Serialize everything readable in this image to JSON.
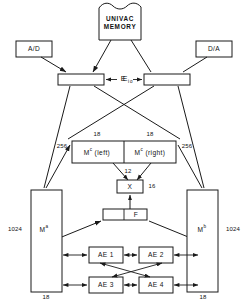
{
  "diagram": {
    "nodes": {
      "univac": {
        "line1": "UNIVAC",
        "line2": "MEMORY",
        "name": "univac-memory"
      },
      "ad": {
        "label": "A/D"
      },
      "da": {
        "label": "D/A"
      },
      "ei": {
        "label": "E",
        "sub": "i"
      },
      "eo": {
        "label": "E",
        "sub": "o"
      },
      "mc_left": {
        "label": "M",
        "sup": "c",
        "suffix": " (left)"
      },
      "mc_right": {
        "label": "M",
        "sup": "c",
        "suffix": " (right)"
      },
      "x": {
        "label": "X"
      },
      "f": {
        "label": "F"
      },
      "ma": {
        "label": "M",
        "sup": "a"
      },
      "mb": {
        "label": "M",
        "sup": "b"
      },
      "ae1": {
        "label": "AE 1"
      },
      "ae2": {
        "label": "AE 2"
      },
      "ae3": {
        "label": "AE 3"
      },
      "ae4": {
        "label": "AE 4"
      }
    },
    "bus_labels": {
      "mc_left_width": "18",
      "mc_right_width": "18",
      "left_256": "256",
      "right_256": "256",
      "x_in": "12",
      "x_out": "16",
      "ma_depth": "1024",
      "mb_depth": "1024",
      "ma_width": "18",
      "mb_width": "18"
    },
    "colors": {
      "stroke": "#1a1a1a",
      "fill": "#ffffff",
      "text": "#111111"
    }
  }
}
